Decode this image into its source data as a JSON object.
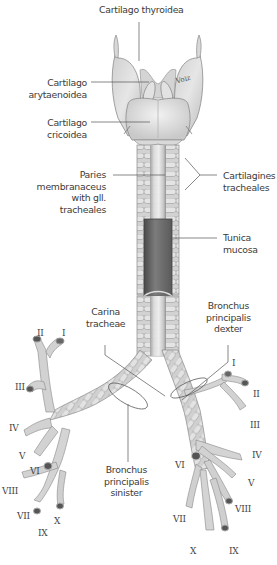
{
  "figure": {
    "colors": {
      "background": "#ffffff",
      "tissue": "#d9d9d9",
      "tissue_light": "#ebebeb",
      "tissue_dark": "#a8a8a8",
      "mucosa": "#7d7d7d",
      "leader_line": "#555555",
      "label_text": "#3a3a3a"
    },
    "labels": {
      "cartilago_thyroidea": [
        "Cartilago thyroidea"
      ],
      "cartilago_arytaenoidea": [
        "Cartilago",
        "arytaenoidea"
      ],
      "cartilago_cricoidea": [
        "Cartilago",
        "cricoidea"
      ],
      "paries_membranaceus": [
        "Paries",
        "membranaceus",
        "with gll.",
        "tracheales"
      ],
      "cartilagines_tracheales": [
        "Cartilagines",
        "tracheales"
      ],
      "tunica_mucosa": [
        "Tunica",
        "mucosa"
      ],
      "carina_tracheae": [
        "Carina",
        "tracheae"
      ],
      "bronchus_principalis_dexter": [
        "Bronchus",
        "principalis",
        "dexter"
      ],
      "bronchus_principalis_sinister": [
        "Bronchus",
        "principalis",
        "sinister"
      ]
    },
    "left_segment_numbers": {
      "II": "II",
      "I": "I",
      "III": "III",
      "IV": "IV",
      "V": "V",
      "VI": "VI",
      "VIII": "VIII",
      "VII": "VII",
      "X": "X",
      "IX": "IX"
    },
    "right_segment_numbers": {
      "I": "I",
      "II": "II",
      "III": "III",
      "IV": "IV",
      "V": "V",
      "VI": "VI",
      "VIII": "VIII",
      "VII": "VII",
      "X": "X",
      "IX": "IX"
    }
  }
}
